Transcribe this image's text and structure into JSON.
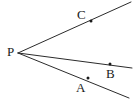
{
  "figure": {
    "type": "geometry-diagram",
    "background_color": "#ffffff",
    "line_color": "#2b2b2b",
    "point_color": "#1a1a1a",
    "width": 133,
    "height": 99,
    "vertex": {
      "name": "P",
      "label": "P",
      "x": 18,
      "y": 53,
      "label_x": 7,
      "label_y": 45
    },
    "rays": [
      {
        "name": "ray-PC",
        "label_point": "C",
        "from_x": 18,
        "from_y": 53,
        "to_x": 131,
        "to_y": 2
      },
      {
        "name": "ray-PB",
        "label_point": "B",
        "from_x": 18,
        "from_y": 53,
        "to_x": 132,
        "to_y": 68
      },
      {
        "name": "ray-PA",
        "label_point": "A",
        "from_x": 18,
        "from_y": 53,
        "to_x": 129,
        "to_y": 98
      }
    ],
    "points": [
      {
        "name": "point-C",
        "label": "C",
        "x": 91,
        "y": 21,
        "label_x": 77,
        "label_y": 8,
        "on_ray": "ray-PC"
      },
      {
        "name": "point-B",
        "label": "B",
        "x": 110,
        "y": 64,
        "label_x": 106,
        "label_y": 67,
        "on_ray": "ray-PB"
      },
      {
        "name": "point-A",
        "label": "A",
        "x": 88,
        "y": 78,
        "label_x": 76,
        "label_y": 81,
        "on_ray": "ray-PA"
      }
    ]
  }
}
